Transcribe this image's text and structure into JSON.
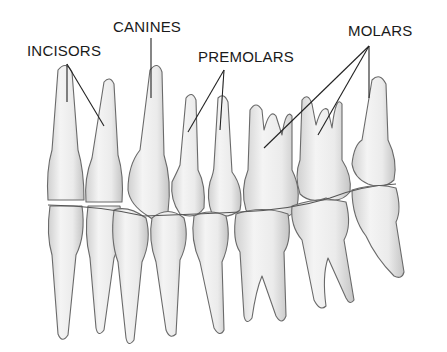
{
  "diagram": {
    "labels": [
      {
        "id": "incisors",
        "text": "INCISORS",
        "x": 27,
        "y": 42
      },
      {
        "id": "canines",
        "text": "CANINES",
        "x": 113,
        "y": 18
      },
      {
        "id": "premolars",
        "text": "PREMOLARS",
        "x": 198,
        "y": 48
      },
      {
        "id": "molars",
        "text": "MOLARS",
        "x": 348,
        "y": 22
      }
    ],
    "colors": {
      "background": "#ffffff",
      "tooth_fill": "#ececec",
      "tooth_shade": "#d2d2d2",
      "outline": "#6a6a6a",
      "leader_line": "#222222",
      "text": "#1a1a1a"
    }
  }
}
